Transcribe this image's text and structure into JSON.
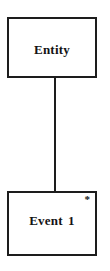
{
  "canvas": {
    "background": "#ffffff"
  },
  "diagram": {
    "colors": {
      "stroke": "#1d1d1d",
      "node_fill": "#ffffff",
      "text": "#141414"
    },
    "entity_node": {
      "label": "Entity"
    },
    "event_node": {
      "label": "Event 1",
      "cardinality_marker": "*"
    },
    "connector": {
      "type": "straight-vertical-line",
      "from": "entity_node",
      "to": "event_node"
    }
  }
}
